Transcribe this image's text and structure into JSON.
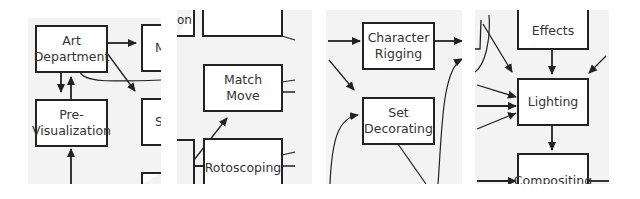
{
  "diagram": {
    "type": "production-pipeline-flowchart-crops",
    "panels": [
      {
        "id": "panel-1",
        "nodes": [
          {
            "id": "art-department",
            "label": "Art Department",
            "lines": [
              "Art",
              "Department"
            ]
          },
          {
            "id": "pre-visualization",
            "label": "Pre-Visualization",
            "lines": [
              "Pre-",
              "Visualization"
            ]
          },
          {
            "id": "partial-m",
            "label": "M",
            "lines": [
              "M"
            ]
          },
          {
            "id": "partial-s",
            "label": "S",
            "lines": [
              "S"
            ]
          }
        ]
      },
      {
        "id": "panel-2",
        "nodes": [
          {
            "id": "partial-on",
            "label": "on",
            "lines": [
              "on"
            ]
          },
          {
            "id": "match-move",
            "label": "Match Move",
            "lines": [
              "Match",
              "Move"
            ]
          },
          {
            "id": "rotoscoping",
            "label": "Rotoscoping",
            "lines": [
              "Rotoscoping"
            ]
          }
        ]
      },
      {
        "id": "panel-3",
        "nodes": [
          {
            "id": "character-rigging",
            "label": "Character Rigging",
            "lines": [
              "Character",
              "Rigging"
            ]
          },
          {
            "id": "set-decorating",
            "label": "Set Decorating",
            "lines": [
              "Set",
              "Decorating"
            ]
          }
        ]
      },
      {
        "id": "panel-4",
        "nodes": [
          {
            "id": "effects",
            "label": "Effects",
            "lines": [
              "Effects"
            ]
          },
          {
            "id": "lighting",
            "label": "Lighting",
            "lines": [
              "Lighting"
            ]
          },
          {
            "id": "compositing",
            "label": "Compositing",
            "lines": [
              "Compositing"
            ]
          }
        ]
      }
    ],
    "edges": [
      {
        "from": "art-department",
        "to": "partial-m"
      },
      {
        "from": "art-department",
        "to": "partial-s"
      },
      {
        "from": "art-department",
        "to": "pre-visualization"
      },
      {
        "from": "pre-visualization",
        "to": "art-department"
      },
      {
        "from": "partial-on",
        "to": "match-move"
      },
      {
        "from": "partial-on",
        "to": "rotoscoping"
      },
      {
        "from": "character-rigging",
        "to": "offscreen"
      },
      {
        "from": "set-decorating",
        "to": "offscreen"
      },
      {
        "from": "effects",
        "to": "lighting"
      },
      {
        "from": "lighting",
        "to": "compositing"
      }
    ],
    "colors": {
      "panel_bg": "#f3f3f3",
      "page_bg": "#ffffff",
      "stroke": "#222222",
      "text": "#333333"
    }
  }
}
